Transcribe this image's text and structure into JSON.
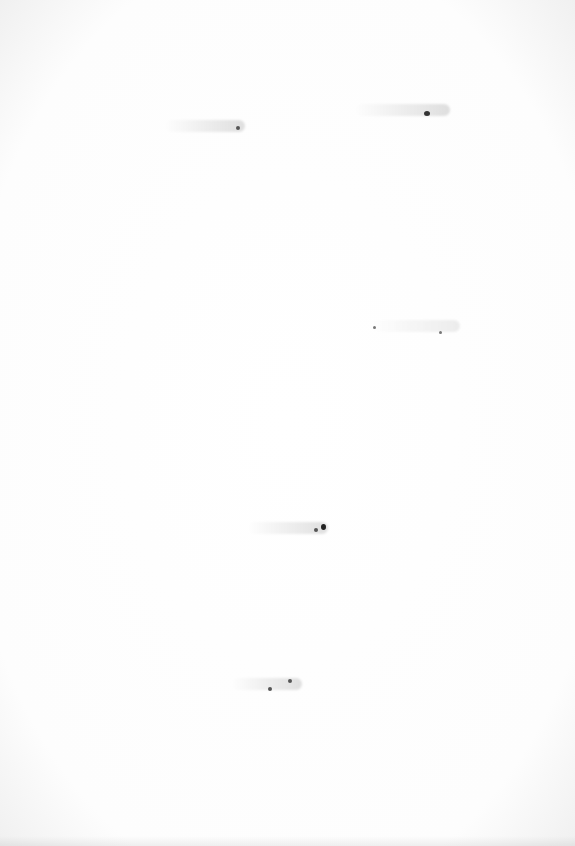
{
  "page": {
    "type": "blank-scanned-page",
    "background": "#ffffff",
    "marks": [
      {
        "x": 165,
        "y": 122,
        "w": 80
      },
      {
        "x": 355,
        "y": 105,
        "w": 95
      },
      {
        "x": 370,
        "y": 322,
        "w": 90
      },
      {
        "x": 245,
        "y": 523,
        "w": 85
      },
      {
        "x": 232,
        "y": 680,
        "w": 70
      }
    ]
  }
}
